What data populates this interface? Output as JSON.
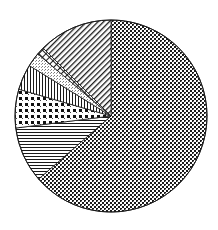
{
  "chart_data": {
    "type": "pie",
    "title": "",
    "legend": "none",
    "labels_visible": false,
    "start_angle_deg": 0,
    "direction": "clockwise",
    "center": [
      111,
      116
    ],
    "radius": 96,
    "slices": [
      {
        "name": "slice-1",
        "pattern": "dense-checker",
        "value": 63.6
      },
      {
        "name": "slice-2",
        "pattern": "horizontal-stripes",
        "value": 9.4
      },
      {
        "name": "slice-3",
        "pattern": "large-dots",
        "value": 6.5
      },
      {
        "name": "slice-4",
        "pattern": "vertical-stripes",
        "value": 4.3
      },
      {
        "name": "slice-5",
        "pattern": "light-stipple",
        "value": 2.4
      },
      {
        "name": "slice-6",
        "pattern": "ladder",
        "value": 1.3
      },
      {
        "name": "slice-7",
        "pattern": "diagonal-stripes",
        "value": 12.5
      }
    ],
    "colors": {
      "ink": "#1a1a1a",
      "background": "#ffffff"
    }
  }
}
